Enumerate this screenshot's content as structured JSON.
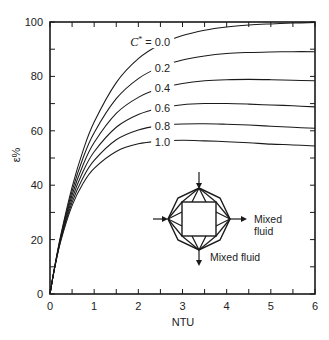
{
  "chart_data": {
    "type": "line",
    "title": "",
    "xlabel": "NTU",
    "ylabel": "ε%",
    "xlim": [
      0,
      6
    ],
    "ylim": [
      0,
      100
    ],
    "xticks": [
      0,
      1,
      2,
      3,
      4,
      5,
      6
    ],
    "xtick_labels": [
      "0",
      "1",
      "2",
      "3",
      "4",
      "5",
      "6"
    ],
    "yticks": [
      0,
      20,
      40,
      60,
      80,
      100
    ],
    "ytick_labels": [
      "0",
      "20",
      "40",
      "60",
      "80",
      "100"
    ],
    "minor_xtick_step": 0.5,
    "minor_ytick_step": 10,
    "grid": false,
    "legend": "inline curve labels",
    "parameter_symbol": "C",
    "parameter_superscript": "*",
    "parameter_equals": " = ",
    "x": [
      0,
      0.1,
      0.25,
      0.5,
      0.75,
      1,
      1.5,
      2,
      2.5,
      3,
      3.5,
      4,
      4.5,
      5,
      5.5,
      6
    ],
    "series": [
      {
        "name": "C* = 0.0",
        "label": "0.0",
        "label_pos": [
          2.72,
          92.6
        ],
        "values": [
          0,
          9.5,
          22.1,
          39.3,
          52.8,
          63.2,
          77.7,
          86.5,
          91.8,
          95.0,
          97.0,
          98.2,
          98.9,
          99.3,
          99.6,
          99.8
        ]
      },
      {
        "name": "C* = 0.2",
        "label": "0.2",
        "label_pos": [
          2.72,
          83.1
        ],
        "values": [
          0,
          9.4,
          21.6,
          37.8,
          50.1,
          59.3,
          71.8,
          79.2,
          83.5,
          86.0,
          87.5,
          88.4,
          88.8,
          89.0,
          89.1,
          89.1
        ]
      },
      {
        "name": "C* = 0.4",
        "label": "0.4",
        "label_pos": [
          2.72,
          75.7
        ],
        "values": [
          0,
          9.3,
          21.2,
          36.4,
          47.5,
          55.7,
          66.4,
          72.3,
          75.6,
          77.4,
          78.4,
          78.8,
          78.9,
          78.8,
          78.6,
          78.4
        ]
      },
      {
        "name": "C* = 0.6",
        "label": "0.6",
        "label_pos": [
          2.72,
          68.4
        ],
        "values": [
          0,
          9.2,
          20.7,
          35.0,
          45.1,
          52.3,
          61.3,
          66.0,
          68.4,
          69.6,
          70.0,
          70.0,
          69.8,
          69.5,
          69.2,
          68.8
        ]
      },
      {
        "name": "C* = 0.8",
        "label": "0.8",
        "label_pos": [
          2.72,
          61.8
        ],
        "values": [
          0,
          9.2,
          20.3,
          33.7,
          42.8,
          49.1,
          56.7,
          60.3,
          61.9,
          62.5,
          62.6,
          62.4,
          62.1,
          61.7,
          61.3,
          60.9
        ]
      },
      {
        "name": "C* = 1.0",
        "label": "1.0",
        "label_pos": [
          2.72,
          55.9
        ],
        "values": [
          0,
          9.1,
          19.8,
          32.5,
          40.7,
          46.2,
          52.4,
          55.2,
          56.2,
          56.5,
          56.3,
          56.0,
          55.6,
          55.1,
          54.8,
          54.4
        ]
      }
    ],
    "annotations": [
      {
        "text": "Mixed fluid",
        "position": "right of inset schematic"
      },
      {
        "text": "Mixed fluid",
        "position": "below inset schematic"
      }
    ]
  },
  "inset": {
    "description": "cross-flow exchanger schematic, both fluids mixed",
    "right_label_lines": [
      "Mixed",
      "fluid"
    ],
    "bottom_label": "Mixed fluid"
  },
  "colors": {
    "line": "#1a1a1a",
    "background": "#ffffff",
    "text": "#222222"
  }
}
